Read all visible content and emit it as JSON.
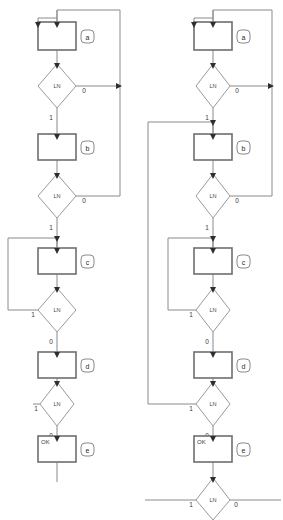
{
  "diagram": {
    "type": "flowchart",
    "title": "",
    "columns": [
      {
        "id": "left",
        "name": "left-flowchart",
        "nodes": [
          {
            "id": "a",
            "kind": "process",
            "tag": "a",
            "text": ""
          },
          {
            "id": "da",
            "kind": "decision",
            "text": "LN",
            "branch_true": "1",
            "branch_false": "0"
          },
          {
            "id": "b",
            "kind": "process",
            "tag": "b",
            "text": ""
          },
          {
            "id": "db",
            "kind": "decision",
            "text": "LN",
            "branch_true": "1",
            "branch_false": "0"
          },
          {
            "id": "c",
            "kind": "process",
            "tag": "c",
            "text": ""
          },
          {
            "id": "dc",
            "kind": "decision",
            "text": "LN",
            "branch_true": "1",
            "branch_false": "0"
          },
          {
            "id": "d",
            "kind": "process",
            "tag": "d",
            "text": ""
          },
          {
            "id": "dd",
            "kind": "decision",
            "text": "LN",
            "branch_true": "1",
            "branch_false": "0"
          },
          {
            "id": "e",
            "kind": "process",
            "tag": "e",
            "text": "OK"
          }
        ]
      },
      {
        "id": "right",
        "name": "right-flowchart",
        "nodes": [
          {
            "id": "a",
            "kind": "process",
            "tag": "a",
            "text": ""
          },
          {
            "id": "da",
            "kind": "decision",
            "text": "LN",
            "branch_true": "1",
            "branch_false": "0"
          },
          {
            "id": "b",
            "kind": "process",
            "tag": "b",
            "text": ""
          },
          {
            "id": "db",
            "kind": "decision",
            "text": "LN",
            "branch_true": "1",
            "branch_false": "0"
          },
          {
            "id": "c",
            "kind": "process",
            "tag": "c",
            "text": ""
          },
          {
            "id": "dc",
            "kind": "decision",
            "text": "LN",
            "branch_true": "1",
            "branch_false": "0"
          },
          {
            "id": "d",
            "kind": "process",
            "tag": "d",
            "text": ""
          },
          {
            "id": "dd",
            "kind": "decision",
            "text": "LN",
            "branch_true": "1",
            "branch_false": "0"
          },
          {
            "id": "e",
            "kind": "process",
            "tag": "e",
            "text": "OK"
          },
          {
            "id": "de",
            "kind": "decision",
            "text": "LN",
            "branch_true": "1",
            "branch_false": "0"
          }
        ]
      }
    ],
    "labels": {
      "decision_text": "LN",
      "one": "1",
      "zero": "0",
      "ok": "OK",
      "tag_a": "a",
      "tag_b": "b",
      "tag_c": "c",
      "tag_d": "d",
      "tag_e": "e"
    },
    "colors": {
      "background": "#ffffff",
      "edge": "#8a8a8a",
      "box_stroke": "#6e6e6e",
      "diamond_stroke": "#9a9a9a",
      "arrow": "#2e2e2e",
      "text": "#3a3a3a"
    }
  }
}
